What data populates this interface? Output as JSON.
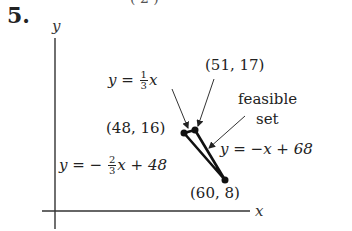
{
  "problem": {
    "number": "5.",
    "top_fragment": "( 2      )"
  },
  "axes": {
    "x_label": "x",
    "y_label": "y"
  },
  "lines": [
    {
      "label_lhs": "y =",
      "frac_num": "1",
      "frac_den": "3",
      "label_rhs": "x",
      "equation": "y = (1/3)x"
    },
    {
      "label_lhs": "y = −",
      "frac_num": "2",
      "frac_den": "3",
      "label_rhs": "x + 48",
      "equation": "y = -(2/3)x + 48"
    },
    {
      "label": "y = −x + 68",
      "equation": "y = -x + 68"
    }
  ],
  "vertices": [
    {
      "label": "(48, 16)",
      "x": 48,
      "y": 16
    },
    {
      "label": "(51, 17)",
      "x": 51,
      "y": 17
    },
    {
      "label": "(60, 8)",
      "x": 60,
      "y": 8
    }
  ],
  "region": {
    "label_line1": "feasible",
    "label_line2": "set"
  },
  "colors": {
    "ink": "#222222",
    "axis": "#333333",
    "background": "#ffffff"
  }
}
